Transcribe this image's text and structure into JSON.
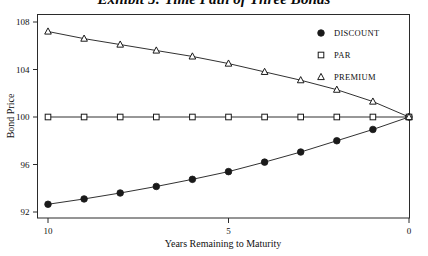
{
  "chart_data": {
    "type": "line",
    "title": "Exhibit 5: Time Path of Three Bonds",
    "xlabel": "Years Remaining to Maturity",
    "ylabel": "Bond Price",
    "x": [
      10,
      9,
      8,
      7,
      6,
      5,
      4,
      3,
      2,
      1,
      0
    ],
    "xlim": [
      10,
      0
    ],
    "ylim": [
      91,
      108.6
    ],
    "xticks": [
      "10",
      "5",
      "0"
    ],
    "xtick_values": [
      10,
      5,
      0
    ],
    "yticks": [
      "92",
      "96",
      "100",
      "104",
      "108"
    ],
    "ytick_values": [
      92,
      96,
      100,
      104,
      108
    ],
    "grid": false,
    "legend_position": "top-right",
    "series": [
      {
        "name": "DISCOUNT",
        "marker": "filled-circle",
        "values": [
          92.65,
          93.1,
          93.6,
          94.15,
          94.75,
          95.4,
          96.2,
          97.05,
          98.0,
          98.95,
          100.0
        ]
      },
      {
        "name": "PAR",
        "marker": "open-square",
        "values": [
          100.0,
          100.0,
          100.0,
          100.0,
          100.0,
          100.0,
          100.0,
          100.0,
          100.0,
          100.0,
          100.0
        ]
      },
      {
        "name": "PREMIUM",
        "marker": "open-triangle",
        "values": [
          107.2,
          106.6,
          106.1,
          105.6,
          105.1,
          104.5,
          103.8,
          103.1,
          102.3,
          101.3,
          100.0
        ]
      }
    ]
  },
  "legend": {
    "items": [
      {
        "label": "DISCOUNT",
        "marker": "filled-circle"
      },
      {
        "label": "PAR",
        "marker": "open-square"
      },
      {
        "label": "PREMIUM",
        "marker": "open-triangle"
      }
    ]
  },
  "colors": {
    "line": "#1a1a1a",
    "frame": "#2b2b2b",
    "text": "#111111",
    "background": "#ffffff"
  }
}
